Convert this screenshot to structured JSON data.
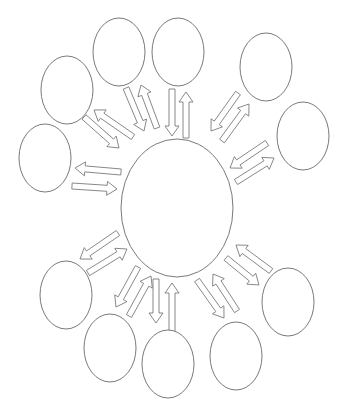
{
  "diagram": {
    "type": "hub-and-spoke bidirectional cycle diagram (blank template)",
    "colors": {
      "stroke": "#7a7a7a",
      "fill": "#ffffff",
      "background": "#ffffff"
    },
    "hub": {
      "cx": 177,
      "cy": 208,
      "rx": 56,
      "ry": 69,
      "label": ""
    },
    "nodes": [
      {
        "id": "top-left",
        "cx": 119,
        "cy": 52,
        "rx": 26,
        "ry": 34,
        "label": ""
      },
      {
        "id": "top",
        "cx": 178,
        "cy": 52,
        "rx": 26,
        "ry": 34,
        "label": ""
      },
      {
        "id": "upper-right",
        "cx": 266,
        "cy": 67,
        "rx": 26,
        "ry": 34,
        "label": ""
      },
      {
        "id": "right",
        "cx": 303,
        "cy": 136,
        "rx": 26,
        "ry": 34,
        "label": ""
      },
      {
        "id": "lower-right",
        "cx": 288,
        "cy": 302,
        "rx": 26,
        "ry": 34,
        "label": ""
      },
      {
        "id": "bottom-right",
        "cx": 236,
        "cy": 356,
        "rx": 26,
        "ry": 34,
        "label": ""
      },
      {
        "id": "bottom",
        "cx": 168,
        "cy": 364,
        "rx": 26,
        "ry": 34,
        "label": ""
      },
      {
        "id": "bottom-left",
        "cx": 110,
        "cy": 348,
        "rx": 26,
        "ry": 34,
        "label": ""
      },
      {
        "id": "lower-left",
        "cx": 66,
        "cy": 295,
        "rx": 26,
        "ry": 34,
        "label": ""
      },
      {
        "id": "left",
        "cx": 45,
        "cy": 158,
        "rx": 26,
        "ry": 34,
        "label": ""
      },
      {
        "id": "upper-left",
        "cx": 67,
        "cy": 90,
        "rx": 26,
        "ry": 34,
        "label": ""
      }
    ],
    "arrows": [
      {
        "node": "top-left",
        "dir": "to-hub",
        "x1": 126,
        "y1": 88,
        "x2": 144,
        "y2": 131
      },
      {
        "node": "top-left",
        "dir": "to-node",
        "x1": 157,
        "y1": 128,
        "x2": 141,
        "y2": 85
      },
      {
        "node": "top",
        "dir": "to-hub",
        "x1": 172,
        "y1": 89,
        "x2": 172,
        "y2": 136
      },
      {
        "node": "top",
        "dir": "to-node",
        "x1": 186,
        "y1": 138,
        "x2": 186,
        "y2": 92
      },
      {
        "node": "upper-right",
        "dir": "to-hub",
        "x1": 238,
        "y1": 93,
        "x2": 211,
        "y2": 131
      },
      {
        "node": "upper-right",
        "dir": "to-node",
        "x1": 222,
        "y1": 141,
        "x2": 249,
        "y2": 104
      },
      {
        "node": "right",
        "dir": "to-hub",
        "x1": 267,
        "y1": 143,
        "x2": 230,
        "y2": 168
      },
      {
        "node": "right",
        "dir": "to-node",
        "x1": 236,
        "y1": 182,
        "x2": 274,
        "y2": 158
      },
      {
        "node": "lower-right",
        "dir": "to-hub",
        "x1": 271,
        "y1": 271,
        "x2": 236,
        "y2": 245
      },
      {
        "node": "lower-right",
        "dir": "to-node",
        "x1": 226,
        "y1": 258,
        "x2": 259,
        "y2": 285
      },
      {
        "node": "bottom-right",
        "dir": "to-hub",
        "x1": 237,
        "y1": 311,
        "x2": 213,
        "y2": 274
      },
      {
        "node": "bottom-right",
        "dir": "to-node",
        "x1": 197,
        "y1": 280,
        "x2": 224,
        "y2": 318
      },
      {
        "node": "bottom",
        "dir": "to-hub",
        "x1": 172,
        "y1": 332,
        "x2": 172,
        "y2": 283
      },
      {
        "node": "bottom",
        "dir": "to-node",
        "x1": 156,
        "y1": 279,
        "x2": 156,
        "y2": 323
      },
      {
        "node": "bottom-left",
        "dir": "to-hub",
        "x1": 129,
        "y1": 316,
        "x2": 151,
        "y2": 276
      },
      {
        "node": "bottom-left",
        "dir": "to-node",
        "x1": 138,
        "y1": 267,
        "x2": 116,
        "y2": 307
      },
      {
        "node": "lower-left",
        "dir": "to-hub",
        "x1": 88,
        "y1": 273,
        "x2": 127,
        "y2": 249
      },
      {
        "node": "lower-left",
        "dir": "to-node",
        "x1": 118,
        "y1": 233,
        "x2": 80,
        "y2": 259
      },
      {
        "node": "left",
        "dir": "to-hub",
        "x1": 72,
        "y1": 186,
        "x2": 117,
        "y2": 189
      },
      {
        "node": "left",
        "dir": "to-node",
        "x1": 121,
        "y1": 172,
        "x2": 75,
        "y2": 168
      },
      {
        "node": "upper-left",
        "dir": "to-hub",
        "x1": 84,
        "y1": 117,
        "x2": 119,
        "y2": 148
      },
      {
        "node": "upper-left",
        "dir": "to-node",
        "x1": 133,
        "y1": 137,
        "x2": 94,
        "y2": 110
      }
    ],
    "arrow_style": {
      "body_width": 6,
      "head_width": 14,
      "head_length": 10
    }
  }
}
